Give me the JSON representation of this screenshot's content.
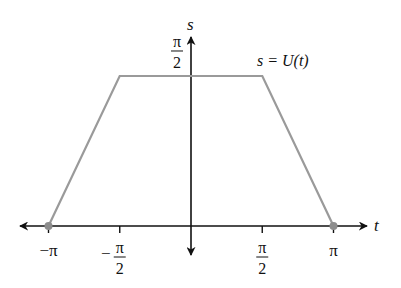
{
  "chart_data": {
    "type": "line",
    "title": "",
    "xlabel": "t",
    "ylabel": "s",
    "xlim": [
      -3.6,
      3.9
    ],
    "ylim": [
      -0.6,
      2.15
    ],
    "grid": false,
    "annotation": "s = U(t)",
    "series": [
      {
        "name": "U(t)",
        "color": "#9a9a9a",
        "points": [
          {
            "x": -3.14159,
            "y": 0
          },
          {
            "x": -1.5708,
            "y": 1.5708
          },
          {
            "x": 1.5708,
            "y": 1.5708
          },
          {
            "x": 3.14159,
            "y": 0
          }
        ]
      }
    ],
    "endpoints": [
      {
        "x": -3.14159,
        "y": 0
      },
      {
        "x": 3.14159,
        "y": 0
      }
    ],
    "x_ticks": [
      {
        "value": -3.14159,
        "label_num": "−π",
        "label_den": ""
      },
      {
        "value": -1.5708,
        "label_num": "−",
        "label_pi": "π",
        "label_den": "2"
      },
      {
        "value": 1.5708,
        "label_num": "",
        "label_pi": "π",
        "label_den": "2"
      },
      {
        "value": 3.14159,
        "label_num": "π",
        "label_den": ""
      }
    ],
    "y_ticks": [
      {
        "value": 1.5708,
        "label_pi": "π",
        "label_den": "2"
      }
    ]
  }
}
